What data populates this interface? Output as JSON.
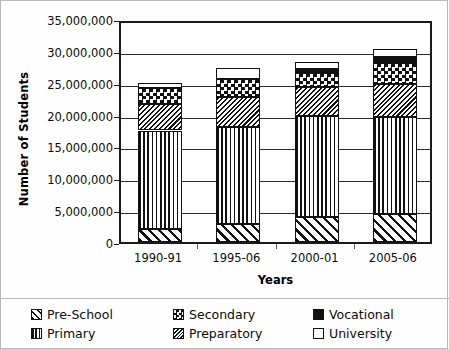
{
  "chart_data": {
    "type": "bar",
    "subtype": "stacked",
    "title": "",
    "xlabel": "Years",
    "ylabel": "Number of Students",
    "categories": [
      "1990-91",
      "1995-06",
      "2000-01",
      "2005-06"
    ],
    "ylim": [
      0,
      35000000
    ],
    "yticks": [
      0,
      5000000,
      10000000,
      15000000,
      20000000,
      25000000,
      30000000,
      35000000
    ],
    "ytick_labels": [
      "0",
      "5,000,000",
      "10,000,000",
      "15,000,000",
      "20,000,000",
      "25,000,000",
      "30,000,000",
      "35,000,000"
    ],
    "grid": true,
    "grid_axis": "y",
    "legend_position": "bottom",
    "series": [
      {
        "name": "Pre-School",
        "pattern": "diagonal-stripes",
        "values": [
          2000000,
          2800000,
          3900000,
          4400000
        ]
      },
      {
        "name": "Primary",
        "pattern": "vertical-lines",
        "values": [
          15500000,
          15300000,
          15800000,
          15200000
        ]
      },
      {
        "name": "Preparatory",
        "pattern": "fine-diagonal-hatch",
        "values": [
          4200000,
          4700000,
          4700000,
          5200000
        ]
      },
      {
        "name": "Secondary",
        "pattern": "checkerboard",
        "values": [
          2400000,
          2800000,
          2100000,
          3300000
        ]
      },
      {
        "name": "Vocational",
        "pattern": "solid-black",
        "values": [
          0,
          0,
          600000,
          900000
        ]
      },
      {
        "name": "University",
        "pattern": "white",
        "values": [
          800000,
          1700000,
          1100000,
          1300000
        ]
      }
    ],
    "totals": [
      24900000,
      27300000,
      28100000,
      32700000
    ]
  },
  "legend": {
    "items": [
      {
        "label": "Pre-School",
        "swatch": "preschool"
      },
      {
        "label": "Primary",
        "swatch": "primary"
      },
      {
        "label": "Secondary",
        "swatch": "secondary"
      },
      {
        "label": "Preparatory",
        "swatch": "preparatory"
      },
      {
        "label": "Vocational",
        "swatch": "vocational"
      },
      {
        "label": "University",
        "swatch": "university"
      }
    ]
  }
}
